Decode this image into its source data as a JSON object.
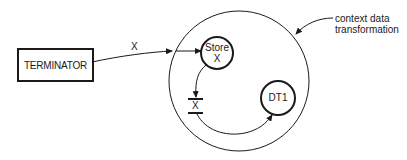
{
  "diagram": {
    "type": "context data transformation diagram",
    "terminator": {
      "label": "TERMINATOR"
    },
    "flow_in": {
      "label": "X"
    },
    "store_node": {
      "line1": "Store",
      "line2": "X"
    },
    "data_store": {
      "label": "X"
    },
    "transformation": {
      "label": "DT1"
    },
    "annotation": {
      "line1": "context data",
      "line2": "transformation"
    },
    "colors": {
      "stroke": "#1a1a1a",
      "background": "#ffffff"
    }
  }
}
